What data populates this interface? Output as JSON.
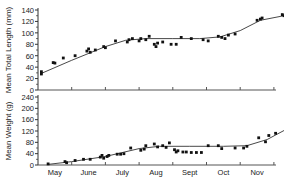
{
  "chart_data": [
    {
      "type": "scatter",
      "title": "",
      "xlabel": "",
      "ylabel": "Mean Total Length (mm)",
      "ylim": [
        0,
        140
      ],
      "yticks": [
        0,
        20,
        40,
        60,
        80,
        100,
        120,
        140
      ],
      "grid": false,
      "legend": null,
      "x_unit": "months since May 1",
      "categories": [
        "May",
        "June",
        "July",
        "Aug",
        "Sept",
        "Oct",
        "Nov"
      ],
      "points": [
        {
          "x": 0.1,
          "y": 28
        },
        {
          "x": 0.1,
          "y": 32
        },
        {
          "x": 0.45,
          "y": 48
        },
        {
          "x": 0.5,
          "y": 47
        },
        {
          "x": 0.75,
          "y": 56
        },
        {
          "x": 1.1,
          "y": 60
        },
        {
          "x": 1.45,
          "y": 68
        },
        {
          "x": 1.5,
          "y": 72
        },
        {
          "x": 1.55,
          "y": 66
        },
        {
          "x": 1.7,
          "y": 70
        },
        {
          "x": 1.95,
          "y": 76
        },
        {
          "x": 2.0,
          "y": 74
        },
        {
          "x": 2.3,
          "y": 86
        },
        {
          "x": 2.65,
          "y": 84
        },
        {
          "x": 2.7,
          "y": 88
        },
        {
          "x": 2.8,
          "y": 90
        },
        {
          "x": 3.0,
          "y": 86
        },
        {
          "x": 3.05,
          "y": 90
        },
        {
          "x": 3.2,
          "y": 88
        },
        {
          "x": 3.3,
          "y": 94
        },
        {
          "x": 3.45,
          "y": 80
        },
        {
          "x": 3.5,
          "y": 76
        },
        {
          "x": 3.55,
          "y": 82
        },
        {
          "x": 3.7,
          "y": 84
        },
        {
          "x": 3.95,
          "y": 80
        },
        {
          "x": 4.1,
          "y": 80
        },
        {
          "x": 4.25,
          "y": 92
        },
        {
          "x": 4.55,
          "y": 90
        },
        {
          "x": 4.9,
          "y": 88
        },
        {
          "x": 5.05,
          "y": 86
        },
        {
          "x": 5.35,
          "y": 94
        },
        {
          "x": 5.45,
          "y": 92
        },
        {
          "x": 5.55,
          "y": 90
        },
        {
          "x": 5.65,
          "y": 96
        },
        {
          "x": 5.85,
          "y": 98
        },
        {
          "x": 6.5,
          "y": 122
        },
        {
          "x": 6.6,
          "y": 124
        },
        {
          "x": 6.65,
          "y": 126
        },
        {
          "x": 7.25,
          "y": 132
        },
        {
          "x": 7.3,
          "y": 130
        }
      ],
      "fit_line": [
        {
          "x": 0.1,
          "y": 29
        },
        {
          "x": 1.0,
          "y": 52
        },
        {
          "x": 2.0,
          "y": 76
        },
        {
          "x": 2.6,
          "y": 87
        },
        {
          "x": 3.2,
          "y": 90
        },
        {
          "x": 4.0,
          "y": 90
        },
        {
          "x": 4.8,
          "y": 90
        },
        {
          "x": 5.4,
          "y": 93
        },
        {
          "x": 6.0,
          "y": 104
        },
        {
          "x": 6.6,
          "y": 122
        },
        {
          "x": 7.3,
          "y": 130
        }
      ]
    },
    {
      "type": "scatter",
      "title": "",
      "xlabel": "",
      "ylabel": "Mean Weight (g)",
      "ylim": [
        0,
        240
      ],
      "yticks": [
        0,
        40,
        80,
        120,
        160,
        200,
        240
      ],
      "grid": false,
      "legend": null,
      "x_unit": "months since May 1",
      "categories": [
        "May",
        "June",
        "July",
        "Aug",
        "Sept",
        "Oct",
        "Nov"
      ],
      "points": [
        {
          "x": 0.3,
          "y": 4
        },
        {
          "x": 0.8,
          "y": 12
        },
        {
          "x": 0.85,
          "y": 8
        },
        {
          "x": 1.1,
          "y": 16
        },
        {
          "x": 1.35,
          "y": 20
        },
        {
          "x": 1.55,
          "y": 20
        },
        {
          "x": 1.85,
          "y": 28
        },
        {
          "x": 1.9,
          "y": 34
        },
        {
          "x": 1.95,
          "y": 24
        },
        {
          "x": 2.05,
          "y": 30
        },
        {
          "x": 2.1,
          "y": 34
        },
        {
          "x": 2.35,
          "y": 38
        },
        {
          "x": 2.45,
          "y": 38
        },
        {
          "x": 2.55,
          "y": 40
        },
        {
          "x": 2.75,
          "y": 60
        },
        {
          "x": 3.05,
          "y": 52
        },
        {
          "x": 3.15,
          "y": 56
        },
        {
          "x": 3.2,
          "y": 68
        },
        {
          "x": 3.45,
          "y": 74
        },
        {
          "x": 3.55,
          "y": 64
        },
        {
          "x": 3.7,
          "y": 68
        },
        {
          "x": 3.8,
          "y": 62
        },
        {
          "x": 3.9,
          "y": 78
        },
        {
          "x": 4.05,
          "y": 54
        },
        {
          "x": 4.1,
          "y": 46
        },
        {
          "x": 4.15,
          "y": 50
        },
        {
          "x": 4.3,
          "y": 46
        },
        {
          "x": 4.4,
          "y": 46
        },
        {
          "x": 4.55,
          "y": 44
        },
        {
          "x": 4.7,
          "y": 44
        },
        {
          "x": 4.85,
          "y": 44
        },
        {
          "x": 5.05,
          "y": 68
        },
        {
          "x": 5.35,
          "y": 68
        },
        {
          "x": 5.45,
          "y": 58
        },
        {
          "x": 5.85,
          "y": 60
        },
        {
          "x": 6.1,
          "y": 60
        },
        {
          "x": 6.2,
          "y": 66
        },
        {
          "x": 6.55,
          "y": 96
        },
        {
          "x": 6.75,
          "y": 82
        },
        {
          "x": 6.85,
          "y": 104
        },
        {
          "x": 7.05,
          "y": 112
        },
        {
          "x": 7.75,
          "y": 160
        },
        {
          "x": 7.9,
          "y": 174
        },
        {
          "x": 8.0,
          "y": 176
        },
        {
          "x": 8.6,
          "y": 222
        },
        {
          "x": 8.65,
          "y": 208
        }
      ],
      "fit_line": [
        {
          "x": 0.3,
          "y": 2
        },
        {
          "x": 1.0,
          "y": 12
        },
        {
          "x": 2.0,
          "y": 30
        },
        {
          "x": 3.0,
          "y": 58
        },
        {
          "x": 3.6,
          "y": 66
        },
        {
          "x": 4.5,
          "y": 66
        },
        {
          "x": 5.5,
          "y": 66
        },
        {
          "x": 6.2,
          "y": 68
        },
        {
          "x": 6.8,
          "y": 90
        },
        {
          "x": 7.4,
          "y": 128
        },
        {
          "x": 8.0,
          "y": 172
        },
        {
          "x": 8.6,
          "y": 216
        }
      ]
    }
  ],
  "axes": {
    "upper": {
      "ylabel": "Mean Total Length (mm)",
      "tick_labels": [
        "0",
        "20",
        "40",
        "60",
        "80",
        "100",
        "120",
        "140"
      ]
    },
    "lower": {
      "ylabel": "Mean Weight (g)",
      "tick_labels": [
        "0",
        "40",
        "80",
        "120",
        "160",
        "200",
        "240"
      ]
    },
    "months": [
      "May",
      "June",
      "July",
      "Aug",
      "Sept",
      "Oct",
      "Nov"
    ]
  }
}
